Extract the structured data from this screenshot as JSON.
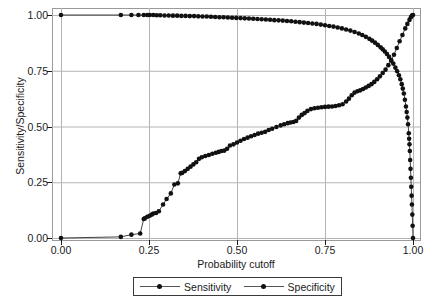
{
  "chart_data": {
    "type": "line",
    "title": "",
    "xlabel": "Probability cutoff",
    "ylabel": "Sensitivity/Specificity",
    "xlim": [
      0.0,
      1.0
    ],
    "ylim": [
      0.0,
      1.0
    ],
    "xticks": [
      "0.00",
      "0.25",
      "0.50",
      "0.75",
      "1.00"
    ],
    "xtick_values": [
      0.0,
      0.25,
      0.5,
      0.75,
      1.0
    ],
    "yticks": [
      "0.00",
      "0.25",
      "0.50",
      "0.75",
      "1.00"
    ],
    "ytick_values": [
      0.0,
      0.25,
      0.5,
      0.75,
      1.0
    ],
    "grid": true,
    "grid_color": "#b4b4b4",
    "legend_position": "below",
    "marker": "filled-circle",
    "line_color": "#111111",
    "series": [
      {
        "name": "Sensitivity",
        "x": [
          0.0,
          0.17,
          0.2,
          0.225,
          0.235,
          0.238,
          0.245,
          0.252,
          0.258,
          0.262,
          0.27,
          0.278,
          0.29,
          0.3,
          0.312,
          0.322,
          0.332,
          0.34,
          0.344,
          0.352,
          0.36,
          0.368,
          0.376,
          0.384,
          0.392,
          0.4,
          0.41,
          0.42,
          0.43,
          0.44,
          0.448,
          0.456,
          0.464,
          0.472,
          0.48,
          0.49,
          0.5,
          0.51,
          0.52,
          0.53,
          0.54,
          0.55,
          0.56,
          0.57,
          0.58,
          0.59,
          0.6,
          0.612,
          0.624,
          0.634,
          0.644,
          0.652,
          0.66,
          0.668,
          0.676,
          0.684,
          0.692,
          0.7,
          0.71,
          0.72,
          0.73,
          0.74,
          0.75,
          0.76,
          0.77,
          0.78,
          0.79,
          0.8,
          0.81,
          0.818,
          0.826,
          0.834,
          0.842,
          0.85,
          0.858,
          0.866,
          0.874,
          0.882,
          0.89,
          0.898,
          0.906,
          0.914,
          0.922,
          0.93,
          0.938,
          0.946,
          0.954,
          0.962,
          0.97,
          0.978,
          0.984,
          0.99,
          0.994,
          0.997,
          1.0
        ],
        "y": [
          0.0,
          0.005,
          0.015,
          0.02,
          0.085,
          0.088,
          0.095,
          0.1,
          0.105,
          0.11,
          0.112,
          0.12,
          0.15,
          0.175,
          0.2,
          0.24,
          0.245,
          0.29,
          0.292,
          0.3,
          0.31,
          0.32,
          0.33,
          0.34,
          0.355,
          0.362,
          0.368,
          0.372,
          0.378,
          0.382,
          0.386,
          0.39,
          0.392,
          0.4,
          0.415,
          0.42,
          0.428,
          0.436,
          0.444,
          0.45,
          0.456,
          0.462,
          0.468,
          0.472,
          0.476,
          0.484,
          0.49,
          0.498,
          0.505,
          0.51,
          0.515,
          0.518,
          0.52,
          0.525,
          0.54,
          0.552,
          0.56,
          0.57,
          0.578,
          0.582,
          0.584,
          0.586,
          0.588,
          0.589,
          0.59,
          0.592,
          0.595,
          0.6,
          0.612,
          0.625,
          0.64,
          0.652,
          0.658,
          0.662,
          0.668,
          0.675,
          0.682,
          0.69,
          0.7,
          0.712,
          0.725,
          0.74,
          0.755,
          0.775,
          0.795,
          0.822,
          0.852,
          0.882,
          0.91,
          0.94,
          0.96,
          0.978,
          0.99,
          0.998,
          1.0
        ]
      },
      {
        "name": "Specificity",
        "x": [
          0.0,
          0.17,
          0.2,
          0.22,
          0.235,
          0.245,
          0.252,
          0.262,
          0.272,
          0.282,
          0.294,
          0.306,
          0.318,
          0.33,
          0.342,
          0.354,
          0.366,
          0.378,
          0.39,
          0.402,
          0.414,
          0.426,
          0.438,
          0.45,
          0.462,
          0.474,
          0.486,
          0.498,
          0.51,
          0.522,
          0.534,
          0.546,
          0.558,
          0.57,
          0.582,
          0.594,
          0.606,
          0.618,
          0.63,
          0.642,
          0.654,
          0.666,
          0.678,
          0.69,
          0.702,
          0.714,
          0.726,
          0.738,
          0.75,
          0.762,
          0.774,
          0.786,
          0.798,
          0.81,
          0.822,
          0.834,
          0.846,
          0.856,
          0.866,
          0.876,
          0.884,
          0.892,
          0.9,
          0.908,
          0.914,
          0.92,
          0.926,
          0.932,
          0.938,
          0.944,
          0.95,
          0.955,
          0.96,
          0.964,
          0.968,
          0.971,
          0.974,
          0.977,
          0.98,
          0.982,
          0.984,
          0.986,
          0.988,
          0.989,
          0.99,
          0.991,
          0.992,
          0.993,
          0.994,
          0.995,
          0.996,
          0.997,
          0.998,
          0.999,
          1.0
        ],
        "y": [
          1.0,
          1.0,
          1.0,
          1.0,
          1.0,
          1.0,
          1.0,
          1.0,
          0.999,
          0.999,
          0.998,
          0.998,
          0.997,
          0.997,
          0.996,
          0.996,
          0.995,
          0.995,
          0.994,
          0.993,
          0.993,
          0.992,
          0.991,
          0.99,
          0.99,
          0.989,
          0.988,
          0.987,
          0.986,
          0.985,
          0.984,
          0.983,
          0.982,
          0.981,
          0.98,
          0.979,
          0.977,
          0.976,
          0.975,
          0.973,
          0.972,
          0.97,
          0.968,
          0.966,
          0.964,
          0.962,
          0.96,
          0.957,
          0.954,
          0.951,
          0.948,
          0.944,
          0.94,
          0.935,
          0.93,
          0.924,
          0.917,
          0.91,
          0.902,
          0.893,
          0.885,
          0.876,
          0.866,
          0.855,
          0.846,
          0.836,
          0.825,
          0.812,
          0.798,
          0.782,
          0.764,
          0.748,
          0.73,
          0.712,
          0.69,
          0.67,
          0.648,
          0.62,
          0.59,
          0.565,
          0.54,
          0.51,
          0.47,
          0.445,
          0.42,
          0.39,
          0.35,
          0.31,
          0.27,
          0.23,
          0.19,
          0.15,
          0.105,
          0.055,
          0.0
        ]
      }
    ]
  },
  "legend": {
    "entries": [
      {
        "label": "Sensitivity"
      },
      {
        "label": "Specificity"
      }
    ]
  }
}
